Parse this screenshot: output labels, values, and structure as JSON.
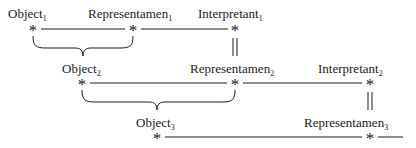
{
  "diagram": {
    "nodes": [
      {
        "id": "o1",
        "base": "Object",
        "sub": "1"
      },
      {
        "id": "r1",
        "base": "Representamen",
        "sub": "1"
      },
      {
        "id": "i1",
        "base": "Interpretant",
        "sub": "1"
      },
      {
        "id": "o2",
        "base": "Object",
        "sub": "2"
      },
      {
        "id": "r2",
        "base": "Representamen",
        "sub": "2"
      },
      {
        "id": "i2",
        "base": "Interpretant",
        "sub": "2"
      },
      {
        "id": "o3",
        "base": "Object",
        "sub": "3"
      },
      {
        "id": "r3",
        "base": "Representamen",
        "sub": "3"
      }
    ],
    "asterisk": "*"
  }
}
